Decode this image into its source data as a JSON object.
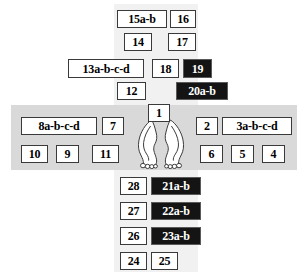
{
  "figure": {
    "colors": {
      "band_horizontal": "#d9d9d9",
      "band_vertical": "#f1f1f1",
      "box_fill": "#ffffff",
      "box_border": "#3a3a3a",
      "box_fill_highlight": "#141414",
      "box_text_highlight": "#ffffff",
      "page_background": "#ffffff"
    }
  },
  "bands": [
    {
      "name": "vertical-band-upper",
      "x": 114,
      "y": 4,
      "w": 84,
      "h": 101
    },
    {
      "name": "horizontal-band",
      "x": 11,
      "y": 105,
      "w": 286,
      "h": 65
    },
    {
      "name": "vertical-band-lower",
      "x": 114,
      "y": 170,
      "w": 84,
      "h": 102
    }
  ],
  "feet": {
    "name": "feet-illustration",
    "label": "outline drawing of left and right foot soles with toes"
  },
  "boxes": [
    {
      "label": "15a-b",
      "x": 117,
      "y": 10,
      "w": 50,
      "h": 18,
      "highlight": false,
      "fs": 12
    },
    {
      "label": "16",
      "x": 170,
      "y": 10,
      "w": 26,
      "h": 18,
      "highlight": false,
      "fs": 12
    },
    {
      "label": "14",
      "x": 124,
      "y": 33,
      "w": 28,
      "h": 18,
      "highlight": false,
      "fs": 12
    },
    {
      "label": "17",
      "x": 168,
      "y": 33,
      "w": 28,
      "h": 18,
      "highlight": false,
      "fs": 12
    },
    {
      "label": "13a-b-c-d",
      "x": 68,
      "y": 59,
      "w": 76,
      "h": 19,
      "highlight": false,
      "fs": 12
    },
    {
      "label": "18",
      "x": 152,
      "y": 59,
      "w": 27,
      "h": 19,
      "highlight": false,
      "fs": 12
    },
    {
      "label": "19",
      "x": 183,
      "y": 59,
      "w": 29,
      "h": 19,
      "highlight": true,
      "fs": 12
    },
    {
      "label": "12",
      "x": 117,
      "y": 82,
      "w": 29,
      "h": 18,
      "highlight": false,
      "fs": 12
    },
    {
      "label": "20a-b",
      "x": 176,
      "y": 82,
      "w": 52,
      "h": 18,
      "highlight": true,
      "fs": 12
    },
    {
      "label": "1",
      "x": 148,
      "y": 104,
      "w": 22,
      "h": 18,
      "highlight": false,
      "fs": 12
    },
    {
      "label": "8a-b-c-d",
      "x": 21,
      "y": 117,
      "w": 76,
      "h": 18,
      "highlight": false,
      "fs": 12
    },
    {
      "label": "7",
      "x": 102,
      "y": 117,
      "w": 22,
      "h": 18,
      "highlight": false,
      "fs": 12
    },
    {
      "label": "2",
      "x": 196,
      "y": 117,
      "w": 22,
      "h": 18,
      "highlight": false,
      "fs": 12
    },
    {
      "label": "3a-b-c-d",
      "x": 222,
      "y": 117,
      "w": 70,
      "h": 18,
      "highlight": false,
      "fs": 12
    },
    {
      "label": "10",
      "x": 21,
      "y": 145,
      "w": 27,
      "h": 18,
      "highlight": false,
      "fs": 12
    },
    {
      "label": "9",
      "x": 56,
      "y": 145,
      "w": 23,
      "h": 18,
      "highlight": false,
      "fs": 12
    },
    {
      "label": "11",
      "x": 92,
      "y": 145,
      "w": 27,
      "h": 18,
      "highlight": false,
      "fs": 12
    },
    {
      "label": "6",
      "x": 200,
      "y": 145,
      "w": 23,
      "h": 18,
      "highlight": false,
      "fs": 12
    },
    {
      "label": "5",
      "x": 231,
      "y": 145,
      "w": 23,
      "h": 18,
      "highlight": false,
      "fs": 12
    },
    {
      "label": "4",
      "x": 262,
      "y": 145,
      "w": 23,
      "h": 18,
      "highlight": false,
      "fs": 12
    },
    {
      "label": "28",
      "x": 120,
      "y": 177,
      "w": 27,
      "h": 18,
      "highlight": false,
      "fs": 12
    },
    {
      "label": "21a-b",
      "x": 151,
      "y": 177,
      "w": 50,
      "h": 18,
      "highlight": true,
      "fs": 12
    },
    {
      "label": "27",
      "x": 120,
      "y": 202,
      "w": 27,
      "h": 18,
      "highlight": false,
      "fs": 12
    },
    {
      "label": "22a-b",
      "x": 151,
      "y": 202,
      "w": 50,
      "h": 18,
      "highlight": true,
      "fs": 12
    },
    {
      "label": "26",
      "x": 120,
      "y": 227,
      "w": 27,
      "h": 18,
      "highlight": false,
      "fs": 12
    },
    {
      "label": "23a-b",
      "x": 151,
      "y": 227,
      "w": 50,
      "h": 18,
      "highlight": true,
      "fs": 12
    },
    {
      "label": "24",
      "x": 120,
      "y": 252,
      "w": 27,
      "h": 18,
      "highlight": false,
      "fs": 12
    },
    {
      "label": "25",
      "x": 151,
      "y": 252,
      "w": 27,
      "h": 18,
      "highlight": false,
      "fs": 12
    }
  ]
}
